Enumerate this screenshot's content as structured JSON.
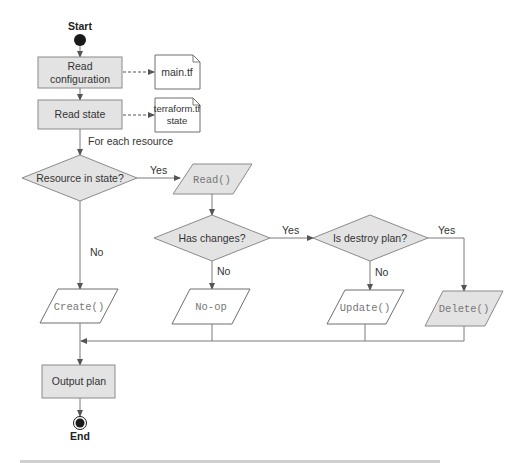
{
  "diagram": {
    "start_label": "Start",
    "end_label": "End",
    "steps": {
      "read_config": [
        "Read",
        "configuration"
      ],
      "read_state": "Read state",
      "output_plan": "Output plan"
    },
    "files": {
      "main_tf": "main.tf",
      "state_file": [
        "terraform.tf",
        "state"
      ]
    },
    "loop_label": "For each resource",
    "decisions": {
      "resource_in_state": "Resource in state?",
      "has_changes": "Has changes?",
      "is_destroy_plan": "Is destroy plan?"
    },
    "actions": {
      "read": "Read()",
      "create": "Create()",
      "noop": "No-op",
      "update": "Update()",
      "delete": "Delete()"
    },
    "edge_labels": {
      "yes": "Yes",
      "no": "No"
    }
  },
  "colors": {
    "shaded_fill": "#e3e3e3",
    "outline": "#8a8a8a",
    "terminal": "#1a1a1a"
  }
}
